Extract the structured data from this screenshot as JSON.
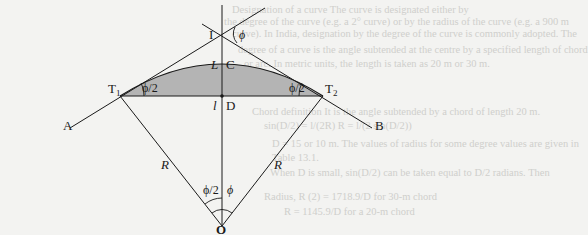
{
  "figure": {
    "points": {
      "I": "I",
      "C": "C",
      "D": "D",
      "T1": "T",
      "T1_sub": "1",
      "T2": "T",
      "T2_sub": "2",
      "A": "A",
      "B": "B",
      "O": "O"
    },
    "lengths": {
      "arc_length": "L",
      "chord_length": "l",
      "radius_left": "R",
      "radius_right": "R"
    },
    "angles": {
      "deflection_at_I": "ϕ",
      "half_angle_T1": "ϕ/2",
      "half_angle_T2": "ϕ/2",
      "half_angle_O": "ϕ/2",
      "central_angle_O": "ϕ"
    },
    "colors": {
      "line": "#1a1a1a",
      "segment_fill": "#b4b4b4",
      "background": "#f3f3f1"
    }
  },
  "bleed_through_text": [
    "Designation of a curve  The curve is designated either by",
    "the degree of the curve (e.g. a 2° curve) or by the radius of the curve (e.g. a 900 m",
    "curve). In India, designation by the degree of the curve is commonly adopted. The",
    "degree of a curve is the angle subtended at the centre by a specified length of chord",
    "or arc. In metric units, the length is taken as 20 m or 30 m.",
    "Chord definition  It is the angle subtended by a chord of length 20 m.",
    "sin(D/2) = l/(2R)    R = l/(2 sin(D/2))",
    "D = 15 or 10 m. The values of radius for some degree values are given in",
    "Table 13.1.",
    "When D is small, sin(D/2) can be taken equal to D/2 radians. Then",
    "Radius, R (2) = 1718.9/D for 30-m chord",
    "R = 1145.9/D for a 20-m chord"
  ]
}
